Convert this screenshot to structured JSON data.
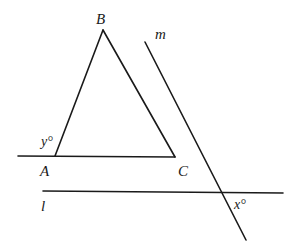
{
  "diagram": {
    "type": "geometry",
    "stroke_color": "#1a1a1a",
    "background": "#ffffff",
    "points": {
      "A": {
        "label": "A",
        "x": 55,
        "y": 156
      },
      "B": {
        "label": "B",
        "x": 103,
        "y": 30
      },
      "C": {
        "label": "C",
        "x": 175,
        "y": 157
      }
    },
    "lines": {
      "m": {
        "label": "m"
      },
      "l": {
        "label": "l"
      }
    },
    "angles": {
      "y": {
        "label": "y°",
        "at": "A"
      },
      "x": {
        "label": "x°",
        "at": "intersection of l and m"
      }
    },
    "segments": [
      {
        "name": "segment-AB",
        "x1": 55,
        "y1": 156,
        "x2": 103,
        "y2": 30
      },
      {
        "name": "segment-BC",
        "x1": 103,
        "y1": 30,
        "x2": 175,
        "y2": 157
      },
      {
        "name": "line-through-AC",
        "x1": 18,
        "y1": 156,
        "x2": 175,
        "y2": 157
      },
      {
        "name": "line-m",
        "x1": 145,
        "y1": 42,
        "x2": 246,
        "y2": 240
      },
      {
        "name": "line-l",
        "x1": 43,
        "y1": 191,
        "x2": 283,
        "y2": 193
      }
    ]
  }
}
